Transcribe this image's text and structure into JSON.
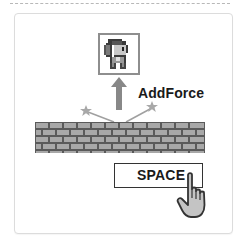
{
  "diagram": {
    "force_label": "AddForce",
    "key_label": "SPACE",
    "icons": {
      "character": "pixel-character-sprite",
      "arrow": "up-arrow",
      "sparks": "star-sparks",
      "wall": "brick-wall",
      "cursor": "pointing-hand-cursor"
    },
    "colors": {
      "arrow": "#888888",
      "sprite_border": "#8e8e8e",
      "wall_mortar": "#5a5a5a",
      "wall_brick": "#a8a8a8",
      "key_border": "#333333",
      "hand_fill": "#c4c4c4",
      "hand_outline": "#333333",
      "text": "#1a1a1a"
    }
  }
}
